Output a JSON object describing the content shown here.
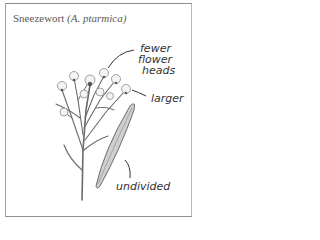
{
  "caption": {
    "common_name": "Sneezewort",
    "scientific_name": "(A. ptarmica)"
  },
  "annotations": {
    "heads_line1": "fewer",
    "heads_line2": "flower",
    "heads_line3": "heads",
    "leaf_size": "larger",
    "leaf_edge": "undivided"
  },
  "colors": {
    "frame": "#8a8a8a",
    "ink": "#333333",
    "caption": "#5a5a5a"
  }
}
